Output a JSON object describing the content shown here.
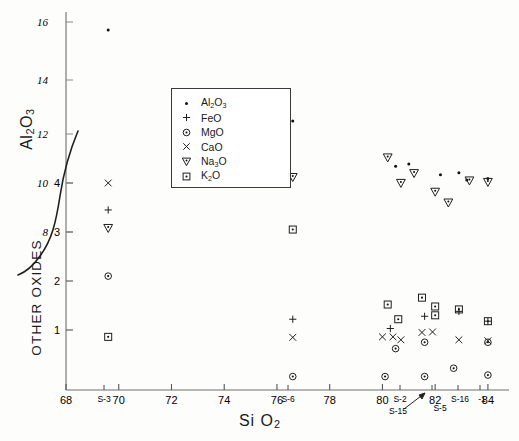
{
  "axes": {
    "x_title": "SiO2",
    "x_title_parts": {
      "main": "Si O",
      "sub": "2"
    },
    "y_title_primary": "Al2O3",
    "y_title_primary_parts": {
      "a": "Al",
      "sub1": "2",
      "b": "O",
      "sub2": "3"
    },
    "y_title_secondary": "OTHER OXIDES",
    "x_ticks": [
      "68",
      "70",
      "72",
      "74",
      "76",
      "78",
      "80",
      "82",
      "84"
    ],
    "y_ticks_primary": [
      "16",
      "14",
      "12",
      "10",
      "8"
    ],
    "y_ticks_secondary": [
      "4",
      "3",
      "2",
      "1"
    ],
    "sample_labels": [
      "S-3",
      "S-6",
      "S-2",
      "S-15",
      "S-5",
      "S-16",
      "-1"
    ]
  },
  "legend": {
    "entries": [
      {
        "label": "Al2O3",
        "marker": "dot",
        "parts": {
          "a": "Al",
          "s1": "2",
          "b": "O",
          "s2": "3"
        }
      },
      {
        "label": "FeO",
        "marker": "plus",
        "parts": {
          "a": "FeO",
          "s1": "",
          "b": "",
          "s2": ""
        }
      },
      {
        "label": "MgO",
        "marker": "circle-dot",
        "parts": {
          "a": "MgO",
          "s1": "",
          "b": "",
          "s2": ""
        }
      },
      {
        "label": "CaO",
        "marker": "cross",
        "parts": {
          "a": "CaO",
          "s1": "",
          "b": "",
          "s2": ""
        }
      },
      {
        "label": "Na3O",
        "marker": "triangle-down",
        "parts": {
          "a": "Na",
          "s1": "3",
          "b": "O",
          "s2": ""
        }
      },
      {
        "label": "K2O",
        "marker": "square-dot",
        "parts": {
          "a": "K",
          "s1": "2",
          "b": "O",
          "s2": ""
        }
      }
    ]
  },
  "chart_data": {
    "type": "scatter",
    "title": "",
    "xlabel": "SiO2",
    "ylabel": "Al2O3 / OTHER OXIDES",
    "xlim": [
      68,
      84.8
    ],
    "ylim_primary": [
      8,
      16
    ],
    "ylim_secondary": [
      0,
      4.35
    ],
    "grid": false,
    "legend_position": "upper-left-inset",
    "note": "Dual stacked vertical scales: upper scale Al2O3 (8-16), lower scale OTHER OXIDES (0-4), joined by a hand-drawn curved axis-break line.",
    "series": [
      {
        "name": "Al2O3",
        "marker": "dot",
        "scale": "primary",
        "points": [
          [
            69.6,
            15.72
          ],
          [
            76.6,
            12.48
          ],
          [
            80.5,
            10.68
          ],
          [
            81.0,
            10.78
          ],
          [
            82.2,
            10.34
          ],
          [
            82.9,
            10.42
          ],
          [
            83.2,
            10.12
          ],
          [
            84.0,
            10.18
          ]
        ]
      },
      {
        "name": "FeO",
        "marker": "plus",
        "scale": "secondary",
        "points": [
          [
            69.6,
            3.45
          ],
          [
            76.6,
            1.22
          ],
          [
            80.3,
            1.03
          ],
          [
            81.6,
            1.28
          ],
          [
            82.9,
            1.38
          ],
          [
            84.0,
            1.18
          ]
        ]
      },
      {
        "name": "MgO",
        "marker": "circle-dot",
        "scale": "secondary",
        "points": [
          [
            69.6,
            2.1
          ],
          [
            76.6,
            0.05
          ],
          [
            80.1,
            0.05
          ],
          [
            80.5,
            0.62
          ],
          [
            81.6,
            0.75
          ],
          [
            81.6,
            0.05
          ],
          [
            82.7,
            0.22
          ],
          [
            84.0,
            0.08
          ],
          [
            84.0,
            0.75
          ]
        ]
      },
      {
        "name": "CaO",
        "marker": "cross",
        "scale": "secondary",
        "points": [
          [
            69.6,
            4.0
          ],
          [
            76.6,
            0.85
          ],
          [
            80.0,
            0.86
          ],
          [
            80.4,
            0.86
          ],
          [
            80.7,
            0.8
          ],
          [
            81.5,
            0.95
          ],
          [
            81.9,
            0.96
          ],
          [
            82.9,
            0.8
          ],
          [
            84.0,
            0.78
          ]
        ]
      },
      {
        "name": "Na3O",
        "marker": "triangle-down",
        "scale": "secondary",
        "points": [
          [
            69.6,
            3.08
          ],
          [
            76.6,
            4.12
          ],
          [
            80.2,
            4.52
          ],
          [
            81.2,
            4.2
          ],
          [
            80.7,
            4.0
          ],
          [
            82.0,
            3.82
          ],
          [
            82.5,
            3.6
          ],
          [
            83.3,
            4.05
          ],
          [
            84.0,
            4.02
          ]
        ]
      },
      {
        "name": "K2O",
        "marker": "square-dot",
        "scale": "secondary",
        "points": [
          [
            69.6,
            0.86
          ],
          [
            76.6,
            3.05
          ],
          [
            80.2,
            1.52
          ],
          [
            80.6,
            1.22
          ],
          [
            81.5,
            1.66
          ],
          [
            82.0,
            1.48
          ],
          [
            82.0,
            1.3
          ],
          [
            82.9,
            1.42
          ],
          [
            84.0,
            1.18
          ]
        ]
      }
    ]
  }
}
